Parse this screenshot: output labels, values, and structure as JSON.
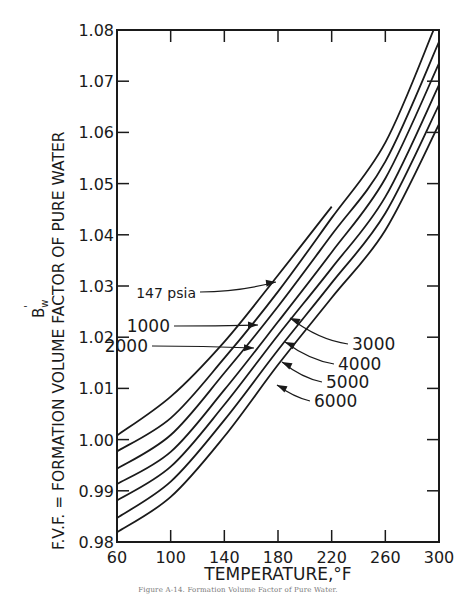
{
  "chart_data": {
    "type": "line",
    "title": "",
    "xlabel": "TEMPERATURE,°F",
    "ylabel": "F.V.F. = FORMATION VOLUME FACTOR OF PURE WATER",
    "ylabel_symbol": "B'w",
    "xlim": [
      60,
      300
    ],
    "ylim": [
      0.98,
      1.08
    ],
    "x_ticks": [
      60,
      100,
      140,
      180,
      220,
      260,
      300
    ],
    "x_tick_labels": [
      "60",
      "100",
      "140",
      "180",
      "220",
      "260",
      "300"
    ],
    "y_ticks": [
      0.98,
      0.99,
      1.0,
      1.01,
      1.02,
      1.03,
      1.04,
      1.05,
      1.06,
      1.07,
      1.08
    ],
    "y_tick_labels": [
      "0.98",
      "0.99",
      "1.00",
      "1.01",
      "1.02",
      "1.03",
      "1.04",
      "1.05",
      "1.06",
      "1.07",
      "1.08"
    ],
    "grid": false,
    "legend": "inline arrow labels",
    "series": [
      {
        "name": "147 psia",
        "x": [
          60,
          100,
          140,
          180,
          220
        ],
        "values": [
          1.0008,
          1.0084,
          1.0191,
          1.0321,
          1.0455
        ]
      },
      {
        "name": "1000",
        "x": [
          60,
          100,
          140,
          180,
          220,
          260,
          296
        ],
        "values": [
          0.9977,
          1.0042,
          1.0159,
          1.0289,
          1.0433,
          1.058,
          1.08
        ]
      },
      {
        "name": "2000",
        "x": [
          60,
          100,
          140,
          180,
          220,
          260,
          300
        ],
        "values": [
          0.9943,
          1.0009,
          1.013,
          1.026,
          1.04,
          1.0543,
          1.0777
        ]
      },
      {
        "name": "3000",
        "x": [
          60,
          100,
          140,
          180,
          220,
          260,
          300
        ],
        "values": [
          0.9913,
          0.9976,
          1.0097,
          1.023,
          1.0366,
          1.051,
          1.0735
        ]
      },
      {
        "name": "4000",
        "x": [
          60,
          100,
          140,
          180,
          220,
          260,
          300
        ],
        "values": [
          0.9881,
          0.9947,
          1.0068,
          1.0204,
          1.0335,
          1.0474,
          1.0693
        ]
      },
      {
        "name": "5000",
        "x": [
          60,
          100,
          140,
          180,
          220,
          260,
          300
        ],
        "values": [
          0.9847,
          0.9918,
          1.0038,
          1.0175,
          1.0306,
          1.0442,
          1.0654
        ]
      },
      {
        "name": "6000",
        "x": [
          60,
          100,
          140,
          180,
          220,
          260,
          300
        ],
        "values": [
          0.9819,
          0.9888,
          1.0006,
          1.0146,
          1.0277,
          1.0409,
          1.0616
        ]
      }
    ],
    "annotations": [
      {
        "text": "147 psia",
        "series": "147 psia",
        "label_pos": [
          196,
          298
        ],
        "arrow_to": [
          276,
          282
        ]
      },
      {
        "text": "1000",
        "series": "1000",
        "label_pos": [
          170,
          332
        ],
        "arrow_to": [
          258,
          325
        ]
      },
      {
        "text": "2000",
        "series": "2000",
        "label_pos": [
          148,
          352
        ],
        "arrow_to": [
          254,
          348
        ]
      },
      {
        "text": "3000",
        "series": "3000",
        "label_pos": [
          352,
          350
        ],
        "arrow_to": [
          290,
          318
        ]
      },
      {
        "text": "4000",
        "series": "4000",
        "label_pos": [
          338,
          370
        ],
        "arrow_to": [
          285,
          342
        ]
      },
      {
        "text": "5000",
        "series": "5000",
        "label_pos": [
          326,
          388
        ],
        "arrow_to": [
          282,
          362
        ]
      },
      {
        "text": "6000",
        "series": "6000",
        "label_pos": [
          314,
          407
        ],
        "arrow_to": [
          277,
          385
        ]
      }
    ]
  },
  "caption": "Figure A-14. Formation Volume Factor of Pure Water."
}
